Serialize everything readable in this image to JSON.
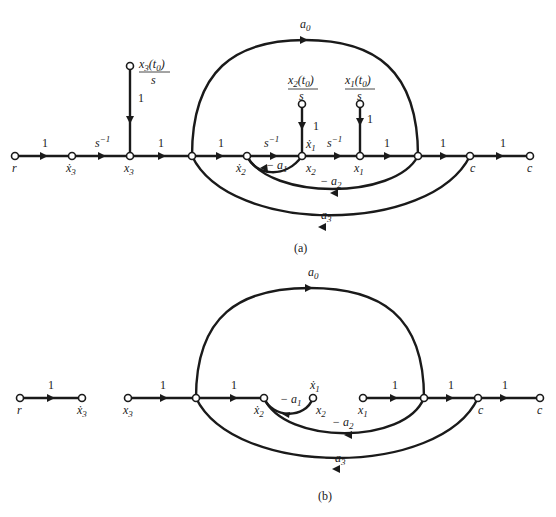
{
  "figure": {
    "parts": [
      {
        "caption": "(a)",
        "nodes": [
          {
            "id": "r",
            "label": "r"
          },
          {
            "id": "x3dot",
            "label": "ẋ3"
          },
          {
            "id": "x3",
            "label": "x3"
          },
          {
            "id": "j1",
            "label": ""
          },
          {
            "id": "x2dot",
            "label": "ẋ2"
          },
          {
            "id": "x2",
            "label": "x2 (ẋ1)"
          },
          {
            "id": "x1",
            "label": "x1"
          },
          {
            "id": "j2",
            "label": ""
          },
          {
            "id": "c1",
            "label": "c"
          },
          {
            "id": "c2",
            "label": "c"
          },
          {
            "id": "ic3",
            "label": "x3(t0)/s"
          },
          {
            "id": "ic2",
            "label": "x2(t0)/s"
          },
          {
            "id": "ic1",
            "label": "x1(t0)/s"
          }
        ],
        "edges": [
          {
            "from": "r",
            "to": "x3dot",
            "gain": "1"
          },
          {
            "from": "x3dot",
            "to": "x3",
            "gain": "s^-1"
          },
          {
            "from": "ic3",
            "to": "x3",
            "gain": "1"
          },
          {
            "from": "x3",
            "to": "j1",
            "gain": "1"
          },
          {
            "from": "j1",
            "to": "x2dot",
            "gain": "1"
          },
          {
            "from": "x2dot",
            "to": "x2",
            "gain": "s^-1"
          },
          {
            "from": "ic2",
            "to": "x2",
            "gain": "1"
          },
          {
            "from": "x2",
            "to": "x1",
            "gain": "s^-1"
          },
          {
            "from": "ic1",
            "to": "x1",
            "gain": "1"
          },
          {
            "from": "x1",
            "to": "j2",
            "gain": "1"
          },
          {
            "from": "j2",
            "to": "c1",
            "gain": "1"
          },
          {
            "from": "c1",
            "to": "c2",
            "gain": "1"
          },
          {
            "from": "j1",
            "to": "j2",
            "gain": "a0"
          },
          {
            "from": "x2",
            "to": "x2dot",
            "gain": "-a1"
          },
          {
            "from": "j2",
            "to": "x2dot",
            "gain": "-a2"
          },
          {
            "from": "c1",
            "to": "j1",
            "gain": "-a3"
          }
        ]
      },
      {
        "caption": "(b)",
        "nodes": [
          {
            "id": "r",
            "label": "r"
          },
          {
            "id": "x3dot",
            "label": "ẋ3"
          },
          {
            "id": "x3",
            "label": "x3"
          },
          {
            "id": "j1",
            "label": ""
          },
          {
            "id": "x2dot",
            "label": "ẋ2"
          },
          {
            "id": "x2",
            "label": "x2 (ẋ1)"
          },
          {
            "id": "x1",
            "label": "x1"
          },
          {
            "id": "j2",
            "label": ""
          },
          {
            "id": "c1",
            "label": "c"
          },
          {
            "id": "c2",
            "label": "c"
          }
        ],
        "edges": [
          {
            "from": "r",
            "to": "x3dot",
            "gain": "1"
          },
          {
            "from": "x3",
            "to": "j1",
            "gain": "1"
          },
          {
            "from": "j1",
            "to": "x2dot",
            "gain": "1"
          },
          {
            "from": "x1",
            "to": "j2",
            "gain": "1"
          },
          {
            "from": "j2",
            "to": "c1",
            "gain": "1"
          },
          {
            "from": "c1",
            "to": "c2",
            "gain": "1"
          },
          {
            "from": "j1",
            "to": "j2",
            "gain": "a0"
          },
          {
            "from": "x2",
            "to": "x2dot",
            "gain": "-a1"
          },
          {
            "from": "j2",
            "to": "x2dot",
            "gain": "-a2"
          },
          {
            "from": "c1",
            "to": "j1",
            "gain": "-a3"
          }
        ]
      }
    ]
  },
  "labels": {
    "one": "1",
    "s": "s",
    "s_inv_exp": "−1",
    "a": "a",
    "minus_a": "− a",
    "sub0": "0",
    "sub1": "1",
    "sub2": "2",
    "sub3": "3",
    "r": "r",
    "x": "x",
    "xdot": "ẋ",
    "c": "c",
    "t0_open": "(t",
    "t0_close": ")",
    "cap_a": "(a)",
    "cap_b": "(b)"
  }
}
